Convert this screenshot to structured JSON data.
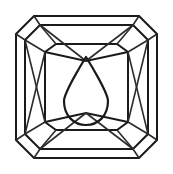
{
  "figure": {
    "background_color": "#ffffff",
    "line_color": "#1a1a1a",
    "width": 173,
    "height": 174,
    "view_label": "plan view",
    "shape_name": "octagonal cut-corner rectangle"
  },
  "geometry": {
    "girdle_outline": "16,34 34,16 139,16 157,34 157,140 139,158 34,158 16,140",
    "crown_outline": "25,40 40,25 133,25 148,40 148,134 133,149 40,149 25,134",
    "table_outline": "45,52 56,44 117,44 128,52 128,122 117,130 56,130 45,122",
    "corner_facets": [
      "16,34 34,16 40,25 25,40",
      "139,16 157,34 148,40 133,25",
      "157,140 139,158 133,149 148,134",
      "34,158 16,140 25,134 40,149"
    ],
    "pavilion_rays": [
      "25,40 45,52",
      "148,40 128,52",
      "148,134 128,122",
      "25,134 45,122",
      "40,25 56,44",
      "133,25 117,44",
      "133,149 117,130",
      "40,149 56,130"
    ],
    "chevron_top": "45,52 86,60 128,52",
    "chevron_bottom": "45,122 86,114 128,122",
    "cross_left": "25,40 45,122",
    "cross_left_2": "25,134 45,52",
    "cross_right": "148,40 128,122",
    "cross_right_2": "148,134 128,52",
    "star_top_left": "40,25 86,60",
    "star_top_right": "133,25 86,60",
    "star_bottom_left": "40,149 86,114",
    "star_bottom_right": "133,149 86,114",
    "inclusion_shape": "pear / teardrop",
    "inclusion_apex": "86,57",
    "inclusion_bulb_center": "86,102",
    "inclusion_bulb_radius": 22
  },
  "labels": {
    "figure_caption": "",
    "annotation": ""
  }
}
